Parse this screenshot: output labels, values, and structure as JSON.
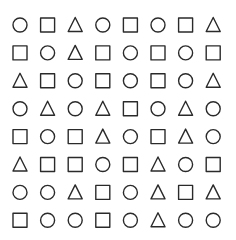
{
  "colors": {
    "stroke": "#2a2a2a",
    "background": "#ffffff"
  },
  "rows": [
    [
      "circle",
      "square",
      "triangle",
      "circle",
      "square",
      "circle",
      "square",
      "triangle"
    ],
    [
      "square",
      "circle",
      "triangle",
      "square",
      "circle",
      "square",
      "circle",
      "square"
    ],
    [
      "triangle",
      "square",
      "circle",
      "square",
      "circle",
      "square",
      "circle",
      "triangle"
    ],
    [
      "circle",
      "triangle",
      "circle",
      "triangle",
      "square",
      "circle",
      "triangle",
      "circle"
    ],
    [
      "square",
      "circle",
      "square",
      "triangle",
      "circle",
      "square",
      "triangle",
      "circle"
    ],
    [
      "triangle",
      "square",
      "square",
      "circle",
      "square",
      "triangle",
      "circle",
      "square"
    ],
    [
      "circle",
      "circle",
      "triangle",
      "square",
      "circle",
      "triangle",
      "square",
      "triangle"
    ],
    [
      "square",
      "circle",
      "circle",
      "square",
      "circle",
      "triangle",
      "circle",
      "circle"
    ]
  ]
}
